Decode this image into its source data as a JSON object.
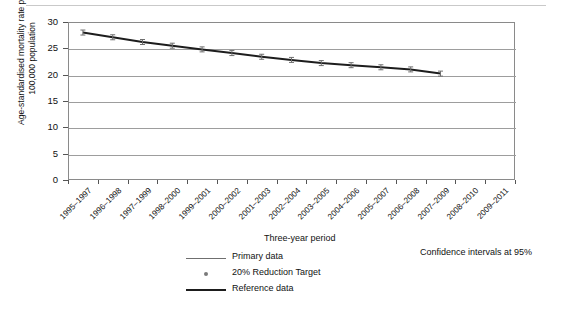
{
  "chart_data": {
    "type": "line",
    "title": "",
    "xlabel": "Three-year period",
    "ylabel": "Age-standardised mortality rate per 100,000 population",
    "ylabel_line1": "Age-standardised mortality rate per",
    "ylabel_line2": "100,000 population",
    "ylim": [
      0,
      30
    ],
    "yticks": [
      0,
      5,
      10,
      15,
      20,
      25,
      30
    ],
    "grid": true,
    "legend_position": "bottom-center",
    "annotation": "Confidence intervals at 95%",
    "categories": [
      "1995–1997",
      "1996–1998",
      "1997–1999",
      "1998–2000",
      "1999–2001",
      "2000–2002",
      "2001–2003",
      "2002–2004",
      "2003–2005",
      "2004–2006",
      "2005–2007",
      "2006–2008",
      "2007–2009",
      "2008–2010",
      "2009–2011"
    ],
    "series": [
      {
        "name": "Primary data",
        "marker": "error-bar",
        "values": [
          28.0,
          27.1,
          26.2,
          25.5,
          24.8,
          24.1,
          23.4,
          22.8,
          22.2,
          21.8,
          21.4,
          21.0,
          20.2,
          null,
          null
        ]
      }
    ],
    "legend": [
      {
        "label": "Primary data",
        "style": "thin-line",
        "color": "#6f6f6f"
      },
      {
        "label": "20% Reduction Target",
        "style": "dot",
        "color": "#7a7a7a"
      },
      {
        "label": "Reference data",
        "style": "thick-line",
        "color": "#1d1d1d"
      }
    ]
  }
}
